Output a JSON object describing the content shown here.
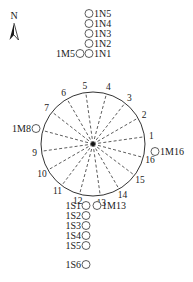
{
  "north_arrow": {
    "label": "N"
  },
  "circle": {
    "cx": 93,
    "cy": 144,
    "r": 52,
    "stroke": "#333333"
  },
  "radial_points": [
    {
      "id": "1",
      "angle": -8
    },
    {
      "id": "2",
      "angle": -30
    },
    {
      "id": "3",
      "angle": -52
    },
    {
      "id": "4",
      "angle": -75
    },
    {
      "id": "5",
      "angle": -98
    },
    {
      "id": "6",
      "angle": -120
    },
    {
      "id": "7",
      "angle": -142
    },
    {
      "id": "8",
      "angle": -165
    },
    {
      "id": "9",
      "angle": 172
    },
    {
      "id": "10",
      "angle": 150
    },
    {
      "id": "11",
      "angle": 127
    },
    {
      "id": "12",
      "angle": 105
    },
    {
      "id": "13",
      "angle": 82
    },
    {
      "id": "14",
      "angle": 60
    },
    {
      "id": "15",
      "angle": 37
    },
    {
      "id": "16",
      "angle": 15
    }
  ],
  "north_markers": [
    {
      "label": "1N5",
      "x": 89,
      "y": 17
    },
    {
      "label": "1N4",
      "x": 89,
      "y": 27
    },
    {
      "label": "1N3",
      "x": 89,
      "y": 37
    },
    {
      "label": "1N2",
      "x": 89,
      "y": 47
    },
    {
      "label": "1N1",
      "x": 89,
      "y": 57
    }
  ],
  "side_markers": [
    {
      "label": "1M5",
      "x": 80,
      "y": 57,
      "side": "left"
    },
    {
      "label": "1M8",
      "x": 36,
      "y": 132,
      "side": "left"
    },
    {
      "label": "1M16",
      "x": 155,
      "y": 155,
      "side": "right"
    },
    {
      "label": "1M13",
      "x": 97,
      "y": 209,
      "side": "right"
    }
  ],
  "south_markers": [
    {
      "label": "1S1",
      "x": 86,
      "y": 209
    },
    {
      "label": "1S2",
      "x": 86,
      "y": 219
    },
    {
      "label": "1S3",
      "x": 86,
      "y": 229
    },
    {
      "label": "1S4",
      "x": 86,
      "y": 239
    },
    {
      "label": "1S5",
      "x": 86,
      "y": 249
    },
    {
      "label": "1S6",
      "x": 86,
      "y": 268
    }
  ]
}
